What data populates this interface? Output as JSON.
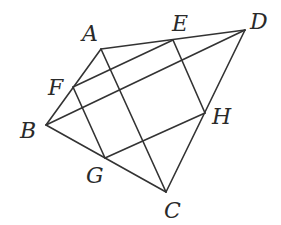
{
  "diagram": {
    "type": "geometry",
    "points": [
      {
        "name": "A",
        "x": 101,
        "y": 49,
        "lx": 82,
        "ly": 41
      },
      {
        "name": "B",
        "x": 46,
        "y": 125,
        "lx": 20,
        "ly": 138
      },
      {
        "name": "C",
        "x": 166,
        "y": 192,
        "lx": 164,
        "ly": 218
      },
      {
        "name": "D",
        "x": 245,
        "y": 30,
        "lx": 250,
        "ly": 29
      },
      {
        "name": "E",
        "x": 173,
        "y": 40,
        "lx": 172,
        "ly": 31
      },
      {
        "name": "F",
        "x": 73,
        "y": 87,
        "lx": 48,
        "ly": 95
      },
      {
        "name": "G",
        "x": 105,
        "y": 158,
        "lx": 86,
        "ly": 183
      },
      {
        "name": "H",
        "x": 205,
        "y": 113,
        "lx": 212,
        "ly": 124
      }
    ],
    "segments": [
      [
        "A",
        "D"
      ],
      [
        "D",
        "C"
      ],
      [
        "C",
        "B"
      ],
      [
        "B",
        "A"
      ],
      [
        "A",
        "C"
      ],
      [
        "B",
        "D"
      ],
      [
        "E",
        "F"
      ],
      [
        "F",
        "G"
      ],
      [
        "G",
        "H"
      ],
      [
        "H",
        "E"
      ]
    ],
    "labels": {
      "A": "A",
      "B": "B",
      "C": "C",
      "D": "D",
      "E": "E",
      "F": "F",
      "G": "G",
      "H": "H"
    }
  }
}
